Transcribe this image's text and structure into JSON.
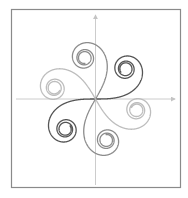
{
  "diagram": {
    "axes": {
      "x_arrow": true,
      "y_arrow": true,
      "color": "#cccccc"
    },
    "frame_color": "#8a8a8a",
    "curve_param_range": [
      -6.0,
      6.0
    ],
    "spirals": [
      {
        "name": "dark-spiral",
        "rotation_deg": 0,
        "color": "#555555"
      },
      {
        "name": "medium-spiral",
        "rotation_deg": 60,
        "color": "#8c8c8c"
      },
      {
        "name": "light-spiral",
        "rotation_deg": 120,
        "color": "#bdbdbd"
      }
    ]
  }
}
